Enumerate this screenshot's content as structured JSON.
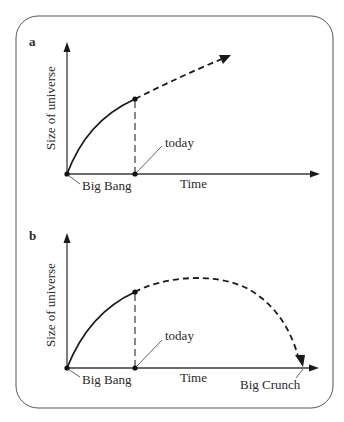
{
  "figure": {
    "border": {
      "color": "#555555",
      "radius": 22
    },
    "panels": [
      {
        "id": "a",
        "label": "a",
        "y_axis_label": "Size of universe",
        "x_axis_label": "Time",
        "origin_label": "Big Bang",
        "today_label": "today",
        "scenario": "expands forever"
      },
      {
        "id": "b",
        "label": "b",
        "y_axis_label": "Size of universe",
        "x_axis_label": "Time",
        "origin_label": "Big Bang",
        "today_label": "today",
        "end_label": "Big Crunch",
        "scenario": "recollapse"
      }
    ]
  }
}
